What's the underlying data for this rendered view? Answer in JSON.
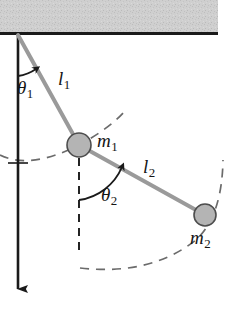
{
  "figure": {
    "name": "double-pendulum-diagram",
    "type": "physics-schematic",
    "background_color": "#ffffff"
  },
  "ceiling": {
    "label": "support-ceiling",
    "fill_color": "#cdcdcd",
    "edge_color": "#1a1a1a",
    "x": 0,
    "y": 0,
    "width": 218,
    "height": 32,
    "edge_line_y": 34,
    "edge_line_thickness": 3
  },
  "vertical_axis": {
    "label": "vertical-reference-axis",
    "color": "#1a1a1a",
    "x": 18,
    "y_start": 34,
    "y_end": 295,
    "has_arrowhead": true,
    "tick_y": 163
  },
  "pivot": {
    "x": 18,
    "y": 35
  },
  "rods": [
    {
      "name": "rod-l1",
      "label": "l",
      "subscript": "1",
      "from": {
        "x": 18,
        "y": 35
      },
      "to": {
        "x": 79,
        "y": 145
      },
      "color": "#9a9a9a",
      "width": 4
    },
    {
      "name": "rod-l2",
      "label": "l",
      "subscript": "2",
      "from": {
        "x": 79,
        "y": 145
      },
      "to": {
        "x": 205,
        "y": 215
      },
      "color": "#9a9a9a",
      "width": 4
    }
  ],
  "masses": [
    {
      "name": "mass-m1",
      "label": "m",
      "subscript": "1",
      "cx": 79,
      "cy": 145,
      "r": 12,
      "fill_color": "#b4b4b4",
      "stroke_color": "#4d4d4d"
    },
    {
      "name": "mass-m2",
      "label": "m",
      "subscript": "2",
      "cx": 205,
      "cy": 215,
      "r": 11,
      "fill_color": "#b4b4b4",
      "stroke_color": "#4d4d4d"
    }
  ],
  "angles": [
    {
      "name": "angle-theta1",
      "label": "θ",
      "subscript": "1",
      "vertex": {
        "x": 18,
        "y": 35
      },
      "from_axis": "vertical-down",
      "to_rod": "rod-l1",
      "value_degrees": 29,
      "arc_radius": 40,
      "arrow_at": "rod-side"
    },
    {
      "name": "angle-theta2",
      "label": "θ",
      "subscript": "2",
      "vertex": {
        "x": 79,
        "y": 145
      },
      "from_axis": "vertical-down",
      "to_rod": "rod-l2",
      "value_degrees": 61,
      "arc_radius": 52,
      "arrow_at": "rod-side"
    }
  ],
  "dashed_elements": [
    {
      "name": "dashed-vertical-from-m1",
      "kind": "line",
      "x": 79,
      "y_start": 157,
      "y_end": 256,
      "color": "#1a1a1a"
    },
    {
      "name": "dashed-arc-radius-l1",
      "kind": "arc",
      "center": {
        "x": 18,
        "y": 35
      },
      "radius": 126,
      "color": "#6b6b6b",
      "description": "swing path of m1 about the pivot"
    },
    {
      "name": "dashed-arc-radius-l2",
      "kind": "arc",
      "center": {
        "x": 79,
        "y": 145
      },
      "radius": 144,
      "color": "#6b6b6b",
      "description": "swing path of m2 about m1"
    }
  ],
  "labels": {
    "theta1": {
      "base": "θ",
      "sub": "1"
    },
    "theta2": {
      "base": "θ",
      "sub": "2"
    },
    "l1": {
      "base": "l",
      "sub": "1"
    },
    "l2": {
      "base": "l",
      "sub": "2"
    },
    "m1": {
      "base": "m",
      "sub": "1"
    },
    "m2": {
      "base": "m",
      "sub": "2"
    }
  }
}
